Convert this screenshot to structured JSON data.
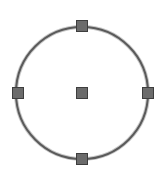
{
  "drawing": {
    "width": 165,
    "height": 180,
    "background": "#ffffff",
    "circle": {
      "cx": 82,
      "cy": 93,
      "r": 66,
      "stroke": "#5a5a5a",
      "halo": "#c8c8c8",
      "stroke_width": 2
    },
    "grips": {
      "size": 11,
      "fill": "#6b6b6b",
      "stroke": "#3e3e3e",
      "items": [
        {
          "name": "grip-center",
          "x": 82,
          "y": 93
        },
        {
          "name": "grip-quadrant-top",
          "x": 82,
          "y": 26
        },
        {
          "name": "grip-quadrant-bottom",
          "x": 82,
          "y": 159
        },
        {
          "name": "grip-quadrant-left",
          "x": 18,
          "y": 93
        },
        {
          "name": "grip-quadrant-right",
          "x": 148,
          "y": 93
        }
      ]
    }
  }
}
